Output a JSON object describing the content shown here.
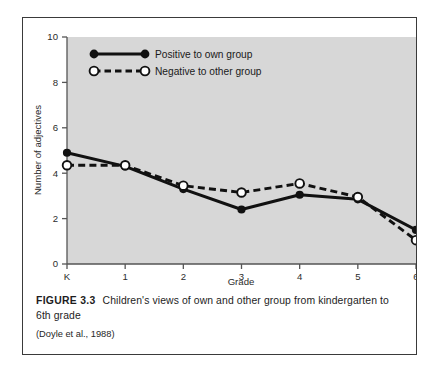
{
  "figure": {
    "label": "FIGURE 3.3",
    "caption": "Children's views of own and other group from kindergarten to 6th grade",
    "source": "(Doyle et al., 1988)"
  },
  "colors": {
    "plot_background": "#d7d7d7",
    "axis": "#555555",
    "series_solid": "#111111",
    "series_dashed": "#111111",
    "marker_open_fill": "#ffffff",
    "frame_border": "#3a3a3a",
    "text": "#1d1d1d"
  },
  "chart_data": {
    "type": "line",
    "title": "",
    "xlabel": "Grade",
    "ylabel": "Number of adjectives",
    "categories": [
      "K",
      "1",
      "2",
      "3",
      "4",
      "5",
      "6"
    ],
    "xtick_labels": [
      "K",
      "1",
      "2",
      "3",
      "4",
      "5",
      "6"
    ],
    "ytick_labels": [
      "0",
      "2",
      "4",
      "6",
      "8",
      "10"
    ],
    "yticks": [
      0,
      2,
      4,
      6,
      8,
      10
    ],
    "ylim": [
      0,
      10
    ],
    "grid": false,
    "legend_position": "top-left inside plot",
    "series": [
      {
        "name": "Positive to own group",
        "values": [
          4.9,
          4.3,
          3.3,
          2.4,
          3.05,
          2.85,
          1.5
        ],
        "line_style": "solid",
        "marker": "filled-circle"
      },
      {
        "name": "Negative to other group",
        "values": [
          4.35,
          4.35,
          3.45,
          3.15,
          3.55,
          2.95,
          1.05
        ],
        "line_style": "dashed",
        "marker": "open-circle"
      }
    ]
  }
}
